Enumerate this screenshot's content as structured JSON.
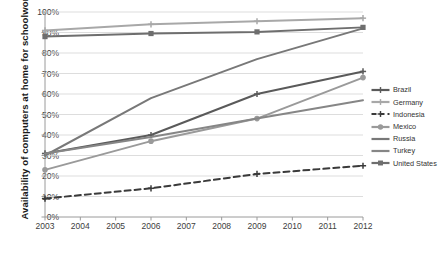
{
  "chart_data": {
    "type": "line",
    "title": "",
    "xlabel": "",
    "ylabel": "Availability of computers at home for schoolwork",
    "x": [
      2003,
      2004,
      2005,
      2006,
      2007,
      2008,
      2009,
      2010,
      2011,
      2012
    ],
    "categories": [
      "2003",
      "2004",
      "2005",
      "2006",
      "2007",
      "2008",
      "2009",
      "2010",
      "2011",
      "2012"
    ],
    "xlim": [
      2003,
      2012
    ],
    "ylim": [
      0,
      100
    ],
    "yticks": [
      "0%",
      "10%",
      "20%",
      "30%",
      "40%",
      "50%",
      "60%",
      "70%",
      "80%",
      "90%",
      "100%"
    ],
    "ytick_values": [
      0,
      10,
      20,
      30,
      40,
      50,
      60,
      70,
      80,
      90,
      100
    ],
    "grid": true,
    "legend_position": "right",
    "series": [
      {
        "name": "Brazil",
        "color": "#5a5a5a",
        "style": "solid",
        "marker": "cross",
        "x": [
          2003,
          2006,
          2009,
          2012
        ],
        "values": [
          31,
          40,
          60,
          71
        ]
      },
      {
        "name": "Germany",
        "color": "#a8a8a8",
        "style": "solid",
        "marker": "cross",
        "x": [
          2003,
          2006,
          2009,
          2012
        ],
        "values": [
          91,
          94,
          95.5,
          97
        ]
      },
      {
        "name": "Indonesia",
        "color": "#3a3a3a",
        "style": "dashed",
        "marker": "cross",
        "x": [
          2003,
          2006,
          2009,
          2012
        ],
        "values": [
          9,
          14,
          21,
          25
        ]
      },
      {
        "name": "Mexico",
        "color": "#9a9a9a",
        "style": "solid",
        "marker": "circle",
        "x": [
          2003,
          2006,
          2009,
          2012
        ],
        "values": [
          23,
          37,
          48,
          68
        ]
      },
      {
        "name": "Russia",
        "color": "#787878",
        "style": "solid",
        "marker": "none",
        "x": [
          2003,
          2006,
          2009,
          2012
        ],
        "values": [
          30,
          58,
          77,
          92
        ]
      },
      {
        "name": "Turkey",
        "color": "#868686",
        "style": "solid",
        "marker": "none",
        "x": [
          2003,
          2006,
          2009,
          2012
        ],
        "values": [
          31,
          39,
          48,
          57
        ]
      },
      {
        "name": "United States",
        "color": "#6e6e6e",
        "style": "solid",
        "marker": "square",
        "x": [
          2003,
          2006,
          2009,
          2012
        ],
        "values": [
          88,
          89.5,
          90.3,
          92.5
        ]
      }
    ]
  },
  "legend": {
    "items": [
      {
        "label": "Brazil"
      },
      {
        "label": "Germany"
      },
      {
        "label": "Indonesia"
      },
      {
        "label": "Mexico"
      },
      {
        "label": "Russia"
      },
      {
        "label": "Turkey"
      },
      {
        "label": "United States"
      }
    ]
  }
}
